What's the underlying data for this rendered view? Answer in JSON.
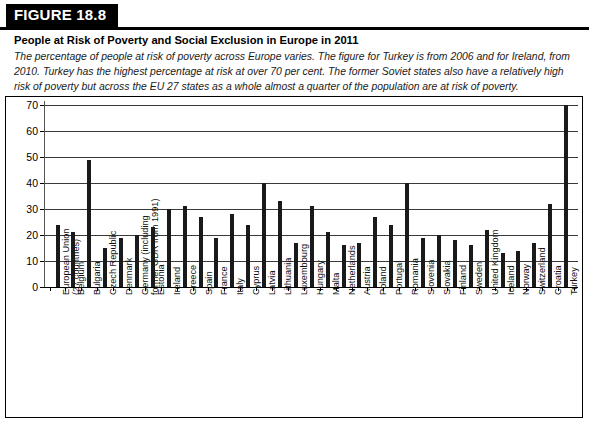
{
  "figure": {
    "label": "FIGURE 18.8",
    "title": "People at Risk of Poverty and Social Exclusion in Europe in 2011",
    "description": "The percentage of people at risk of poverty across Europe varies. The figure for Turkey is from 2006 and for Ireland, from 2010. Turkey has the highest percentage at risk at over 70 per cent. The former Soviet states also have a relatively high risk of poverty but across the EU 27 states as a whole almost a quarter of the population are at risk of poverty."
  },
  "chart_data": {
    "type": "bar",
    "title": "People at Risk of Poverty and Social Exclusion in Europe in 2011",
    "xlabel": "",
    "ylabel": "",
    "ylim": [
      0,
      70
    ],
    "yticks": [
      0,
      10,
      20,
      30,
      40,
      50,
      60,
      70
    ],
    "grid": true,
    "legend": false,
    "bar_color": "#1a1a1a",
    "categories": [
      "European Union\n(27 countries)",
      "Belgium",
      "Bulgaria",
      "Czech Republic",
      "Denmark",
      "Germany (including\nformer GDR from 1991)",
      "Estonia",
      "Ireland",
      "Greece",
      "Spain",
      "France",
      "Italy",
      "Cyprus",
      "Latvia",
      "Lithuania",
      "Luxembourg",
      "Hungary",
      "Malta",
      "Netherlands",
      "Austria",
      "Poland",
      "Portugal",
      "Romania",
      "Slovenia",
      "Slovakia",
      "Finland",
      "Sweden",
      "United Kingdom",
      "Iceland",
      "Norway",
      "Switzerland",
      "Croatia",
      "Turkey"
    ],
    "values": [
      24,
      21,
      49,
      15,
      19,
      20,
      23,
      30,
      31,
      27,
      19,
      28,
      24,
      40,
      33,
      17,
      31,
      21,
      16,
      17,
      27,
      24,
      40,
      19,
      20,
      18,
      16,
      22,
      13,
      14,
      17,
      32,
      70
    ],
    "series": [
      {
        "name": "People at risk of poverty and social exclusion (%)",
        "values": [
          24,
          21,
          49,
          15,
          19,
          20,
          23,
          30,
          31,
          27,
          19,
          28,
          24,
          40,
          33,
          17,
          31,
          21,
          16,
          17,
          27,
          24,
          40,
          19,
          20,
          18,
          16,
          22,
          13,
          14,
          17,
          32,
          70
        ]
      }
    ]
  }
}
